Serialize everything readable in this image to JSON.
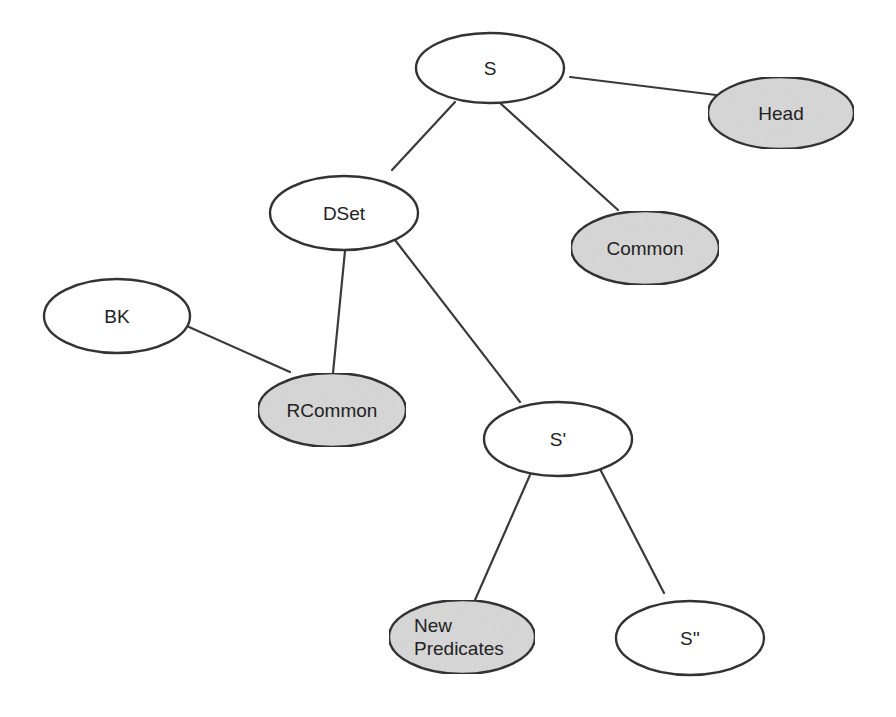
{
  "diagram": {
    "type": "tree",
    "colors": {
      "stroke": "#333333",
      "edge": "#3a3a3a",
      "shaded_fill": "#d9d9d9",
      "plain_fill": "#ffffff",
      "text": "#222222"
    },
    "nodes": [
      {
        "id": "S",
        "label": [
          "S"
        ],
        "shaded": false
      },
      {
        "id": "Head",
        "label": [
          "Head"
        ],
        "shaded": true
      },
      {
        "id": "DSet",
        "label": [
          "DSet"
        ],
        "shaded": false
      },
      {
        "id": "Common",
        "label": [
          "Common"
        ],
        "shaded": true
      },
      {
        "id": "BK",
        "label": [
          "BK"
        ],
        "shaded": false
      },
      {
        "id": "RCommon",
        "label": [
          "RCommon"
        ],
        "shaded": true
      },
      {
        "id": "S1",
        "label": [
          "S'"
        ],
        "shaded": false
      },
      {
        "id": "NewPredicates",
        "label": [
          "New",
          "Predicates"
        ],
        "shaded": true
      },
      {
        "id": "S2",
        "label": [
          "S''"
        ],
        "shaded": false
      }
    ],
    "edges": [
      {
        "from": "S",
        "to": "Head"
      },
      {
        "from": "S",
        "to": "DSet"
      },
      {
        "from": "S",
        "to": "Common"
      },
      {
        "from": "DSet",
        "to": "RCommon"
      },
      {
        "from": "BK",
        "to": "RCommon"
      },
      {
        "from": "DSet",
        "to": "S1"
      },
      {
        "from": "S1",
        "to": "NewPredicates"
      },
      {
        "from": "S1",
        "to": "S2"
      }
    ]
  }
}
